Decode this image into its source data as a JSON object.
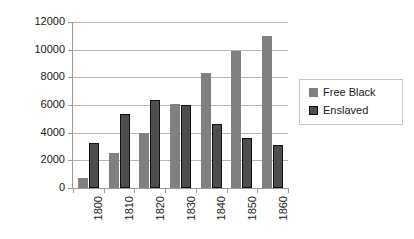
{
  "chart_data": {
    "type": "bar",
    "title": "",
    "subtitle": "",
    "xlabel": "",
    "ylabel": "",
    "categories": [
      "1800",
      "1810",
      "1820",
      "1830",
      "1840",
      "1850",
      "1860"
    ],
    "series": [
      {
        "name": "Free Black",
        "color": "#808080",
        "values": [
          700,
          2500,
          4000,
          6100,
          8300,
          9900,
          11000
        ]
      },
      {
        "name": "Enslaved",
        "color": "#4d4d4d",
        "values": [
          3250,
          5350,
          6350,
          6000,
          4600,
          3600,
          3100
        ]
      }
    ],
    "ylim": [
      0,
      12000
    ],
    "yticks": [
      0,
      2000,
      4000,
      6000,
      8000,
      10000,
      12000
    ],
    "ytick_labels": [
      "0",
      "2000",
      "4000",
      "6000",
      "8000",
      "10000",
      "12000"
    ],
    "grid": true,
    "grid_axis": "y",
    "legend_position": "right",
    "xtick_rotation": -90,
    "bar_group_mode": "grouped"
  }
}
